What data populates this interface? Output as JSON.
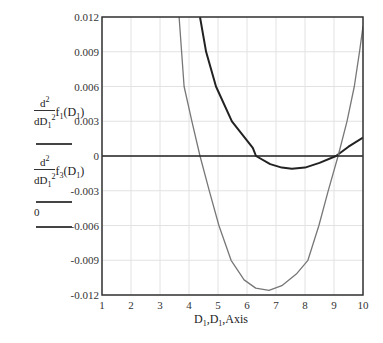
{
  "chart_data": {
    "type": "line",
    "title": "",
    "xlabel": "D1,D1,Axis",
    "ylabel": "",
    "xlim": [
      1,
      10
    ],
    "ylim": [
      -0.012,
      0.012
    ],
    "grid": true,
    "legend_position": "left",
    "x_ticks": [
      "1",
      "2",
      "3",
      "4",
      "5",
      "6",
      "7",
      "8",
      "9",
      "10"
    ],
    "y_ticks": [
      "0.012",
      "0.009",
      "0.006",
      "0.003",
      "0",
      "-0.003",
      "-0.006",
      "-0.009",
      "-0.012"
    ],
    "series": [
      {
        "name": "d²/dD1² f1(D1)",
        "color": "#222222",
        "width": 2,
        "points": [
          [
            4.38,
            0.012
          ],
          [
            4.59,
            0.009
          ],
          [
            4.93,
            0.006
          ],
          [
            5.48,
            0.003
          ],
          [
            6.2,
            0.0007
          ],
          [
            6.31,
            0.0
          ],
          [
            6.8,
            -0.0007
          ],
          [
            7.2,
            -0.001
          ],
          [
            7.55,
            -0.0011
          ],
          [
            8.0,
            -0.001
          ],
          [
            8.5,
            -0.0006
          ],
          [
            9.07,
            0.0
          ],
          [
            9.5,
            0.0008
          ],
          [
            10.0,
            0.0016
          ]
        ]
      },
      {
        "name": "d²/dD1² f3(D1)",
        "color": "#777777",
        "width": 1.3,
        "points": [
          [
            3.66,
            0.012
          ],
          [
            3.83,
            0.006
          ],
          [
            4.1,
            0.003
          ],
          [
            4.38,
            0.0
          ],
          [
            4.7,
            -0.003
          ],
          [
            5.03,
            -0.006
          ],
          [
            5.45,
            -0.009
          ],
          [
            5.9,
            -0.0107
          ],
          [
            6.3,
            -0.0114
          ],
          [
            6.76,
            -0.0116
          ],
          [
            7.2,
            -0.0112
          ],
          [
            7.7,
            -0.0102
          ],
          [
            8.1,
            -0.009
          ],
          [
            8.48,
            -0.006
          ],
          [
            8.8,
            -0.003
          ],
          [
            9.14,
            0.0
          ],
          [
            9.45,
            0.003
          ],
          [
            9.7,
            0.006
          ],
          [
            9.88,
            0.009
          ],
          [
            10.0,
            0.0112
          ]
        ]
      },
      {
        "name": "0",
        "color": "#222222",
        "width": 1.5,
        "points": [
          [
            1,
            0
          ],
          [
            10,
            0
          ]
        ]
      }
    ]
  },
  "legend": {
    "f1": {
      "num": "d",
      "num_sup": "2",
      "den": "dD",
      "den_sub": "1",
      "den_sup": "2",
      "fn": "f",
      "fn_sub": "1",
      "arg": "(D",
      "arg_sub": "1",
      "arg_close": ")"
    },
    "f3": {
      "num": "d",
      "num_sup": "2",
      "den": "dD",
      "den_sub": "1",
      "den_sup": "2",
      "fn": "f",
      "fn_sub": "3",
      "arg": "(D",
      "arg_sub": "1",
      "arg_close": ")"
    },
    "zero": "0"
  },
  "axis_label": {
    "x": "D",
    "x_sub": "1",
    "sep1": ",D",
    "x2_sub": "1",
    "rest": ",Axis"
  }
}
